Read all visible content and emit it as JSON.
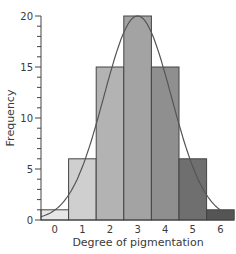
{
  "chart_data": {
    "type": "bar",
    "title": "",
    "xlabel": "Degree of pigmentation",
    "ylabel": "Frequency",
    "categories": [
      "0",
      "1",
      "2",
      "3",
      "4",
      "5",
      "6"
    ],
    "values": [
      1,
      6,
      15,
      20,
      15,
      6,
      1
    ],
    "ylim": [
      0,
      20
    ],
    "yticks_major": [
      0,
      5,
      10,
      15,
      20
    ],
    "yticks_minor_step": 1,
    "grid": false,
    "legend": null,
    "bar_colors": [
      "#e6e6e6",
      "#cfcfcf",
      "#b3b3b3",
      "#a3a3a3",
      "#8f8f8f",
      "#6f6f6f",
      "#555555"
    ],
    "overlay": {
      "type": "line",
      "description": "Normal distribution curve fitted over the histogram",
      "color": "#555555",
      "mean": 3,
      "peak": 20
    }
  }
}
